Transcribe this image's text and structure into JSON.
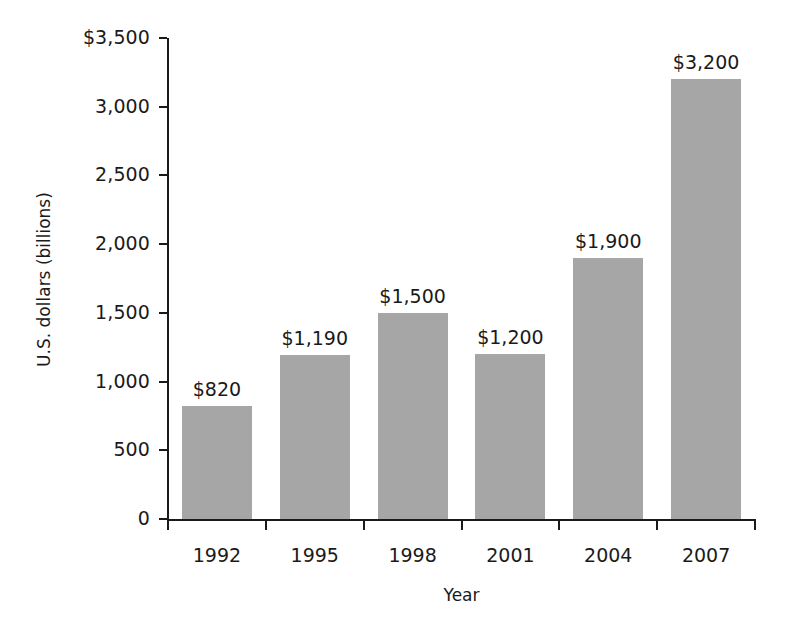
{
  "chart_data": {
    "type": "bar",
    "title": "",
    "subtitle": "",
    "xlabel": "Year",
    "ylabel": "U.S. dollars (billions)",
    "categories": [
      "1992",
      "1995",
      "1998",
      "2001",
      "2004",
      "2007"
    ],
    "values": [
      820,
      1190,
      1500,
      1200,
      1900,
      3200
    ],
    "value_labels": [
      "$820",
      "$1,190",
      "$1,500",
      "$1,200",
      "$1,900",
      "$3,200"
    ],
    "series": [
      {
        "name": "U.S. dollars (billions)",
        "values": [
          820,
          1190,
          1500,
          1200,
          1900,
          3200
        ]
      }
    ],
    "ylim": [
      0,
      3500
    ],
    "ytick_values": [
      0,
      500,
      1000,
      1500,
      2000,
      2500,
      3000,
      3500
    ],
    "ytick_labels": [
      "0",
      "500",
      "1,000",
      "1,500",
      "2,000",
      "2,500",
      "3,000",
      "$3,500"
    ],
    "grid": false,
    "legend": false,
    "legend_position": "none",
    "bar_color": "#a6a6a6",
    "axis_color": "#1a1a1a",
    "text_color": "#1a1a1a",
    "background_color": "#ffffff"
  }
}
